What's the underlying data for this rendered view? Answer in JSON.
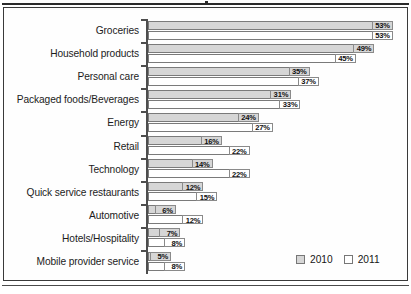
{
  "chart_data": {
    "type": "bar",
    "orientation": "horizontal",
    "title": "",
    "xlabel": "",
    "ylabel": "",
    "xlim": [
      0,
      53
    ],
    "grid": false,
    "legend_position": "bottom-right",
    "categories": [
      "Groceries",
      "Household products",
      "Personal care",
      "Packaged foods/Beverages",
      "Energy",
      "Retail",
      "Technology",
      "Quick service restaurants",
      "Automotive",
      "Hotels/Hospitality",
      "Mobile provider service"
    ],
    "series": [
      {
        "name": "2010",
        "color": "#d6d6d6",
        "values": [
          53,
          49,
          35,
          31,
          24,
          16,
          14,
          12,
          6,
          7,
          5
        ],
        "labels": [
          "53%",
          "49%",
          "35%",
          "31%",
          "24%",
          "16%",
          "14%",
          "12%",
          "6%",
          "7%",
          "5%"
        ]
      },
      {
        "name": "2011",
        "color": "#ffffff",
        "values": [
          53,
          45,
          37,
          33,
          27,
          22,
          22,
          15,
          12,
          8,
          8
        ],
        "labels": [
          "53%",
          "45%",
          "37%",
          "33%",
          "27%",
          "22%",
          "22%",
          "15%",
          "12%",
          "8%",
          "8%"
        ]
      }
    ]
  },
  "legend": {
    "items": [
      {
        "label": "2010",
        "color": "#d6d6d6"
      },
      {
        "label": "2011",
        "color": "#ffffff"
      }
    ]
  }
}
